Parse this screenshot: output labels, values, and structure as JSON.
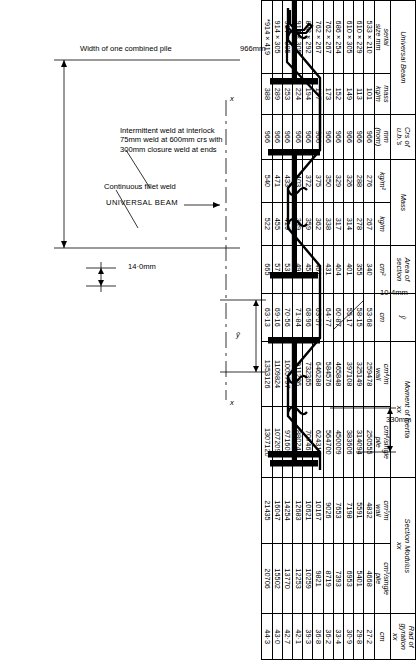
{
  "document": {
    "type": "engineering-reference-table",
    "subject": "Combined sheet pile wall section properties"
  },
  "diagram": {
    "labels": {
      "dim_330": "330mm",
      "dim_10_4": "10·4mm",
      "dim_14_0": "14·0mm",
      "weld_intermittent": "Intermittent weld at interlock\n75mm weld at 600mm crs with\n300mm closure weld at ends",
      "weld_continuous": "Continuous fillet weld",
      "width_combined": "Width of one combined pile",
      "dim_966": "966mm",
      "universal_beam": "UNIVERSAL BEAM",
      "axis_x_left": "x",
      "axis_x_right": "x",
      "axis_y_bar": "ȳ"
    }
  },
  "table": {
    "group_headers": [
      {
        "label": "Universal Beam",
        "span": 2
      },
      {
        "label": "Crs of\nu.b.'s",
        "span": 1
      },
      {
        "label": "Mass",
        "span": 2
      },
      {
        "label": "Area of\nsection",
        "span": 1
      },
      {
        "label": "ȳ",
        "span": 1
      },
      {
        "label": "Moment of Inertia\nxx",
        "span": 2
      },
      {
        "label": "Section Modulus\nxx",
        "span": 2
      },
      {
        "label": "Rad of\ngyration\nxx",
        "span": 1
      }
    ],
    "columns": [
      {
        "key": "serial_size",
        "header_top": "serial",
        "header_bot": "size mm"
      },
      {
        "key": "ub_mass",
        "header_top": "mass",
        "header_bot": "kg/m"
      },
      {
        "key": "crs",
        "header_top": "mm",
        "header_bot": "(nom)"
      },
      {
        "key": "mass_kgm2",
        "header_top": "kg/m²",
        "header_bot": ""
      },
      {
        "key": "mass_kgm",
        "header_top": "kg/m",
        "header_bot": ""
      },
      {
        "key": "area",
        "header_top": "cm²",
        "header_bot": ""
      },
      {
        "key": "ybar",
        "header_top": "cm",
        "header_bot": ""
      },
      {
        "key": "I_m_wall",
        "header_top": "cm⁴/m",
        "header_bot": "wall"
      },
      {
        "key": "I_single",
        "header_top": "cm⁴/single",
        "header_bot": "pile"
      },
      {
        "key": "Z_m_wall",
        "header_top": "cm³/m",
        "header_bot": "wall"
      },
      {
        "key": "Z_single",
        "header_top": "cm³/single",
        "header_bot": "pile"
      },
      {
        "key": "r_xx",
        "header_top": "cm",
        "header_bot": ""
      }
    ],
    "rows": [
      {
        "serial_size": "533 × 210",
        "ub_mass": "101",
        "crs": "966",
        "mass_kgm2": "276",
        "mass_kgm": "267",
        "area": "340",
        "ybar": "53·68",
        "I_m_wall": "259478",
        "I_single": "250555",
        "Z_m_wall": "4832",
        "Z_single": "4668",
        "r_xx": "27·2"
      },
      {
        "serial_size": "610 × 229",
        "ub_mass": "113",
        "crs": "966",
        "mass_kgm2": "288",
        "mass_kgm": "278",
        "area": "355",
        "ybar": "58·15",
        "I_m_wall": "325149",
        "I_single": "314094",
        "Z_m_wall": "5591",
        "Z_single": "5401",
        "r_xx": "29·8"
      },
      {
        "serial_size": "610 × 305",
        "ub_mass": "149",
        "crs": "966",
        "mass_kgm2": "326",
        "mass_kgm": "314",
        "area": "401",
        "ybar": "55·17",
        "I_m_wall": "397108",
        "I_single": "383606",
        "Z_m_wall": "7198",
        "Z_single": "6953",
        "r_xx": "30·9"
      },
      {
        "serial_size": "686 × 254",
        "ub_mass": "152",
        "crs": "966",
        "mass_kgm2": "329",
        "mass_kgm": "317",
        "area": "404",
        "ybar": "60·87",
        "I_m_wall": "465848",
        "I_single": "450009",
        "Z_m_wall": "7653",
        "Z_single": "7393",
        "r_xx": "33·4"
      },
      {
        "serial_size": "762 × 267",
        "ub_mass": "173",
        "crs": "966",
        "mass_kgm2": "350",
        "mass_kgm": "338",
        "area": "431",
        "ybar": "64·77",
        "I_m_wall": "584576",
        "I_single": "564700",
        "Z_m_wall": "9026",
        "Z_single": "8719",
        "r_xx": "36·2"
      },
      {
        "serial_size": "762 × 267",
        "ub_mass": "197",
        "crs": "966",
        "mass_kgm2": "375",
        "mass_kgm": "362",
        "area": "461",
        "ybar": "63·57",
        "I_m_wall": "646288",
        "I_single": "624314",
        "Z_m_wall": "10167",
        "Z_single": "9821",
        "r_xx": "36·8"
      },
      {
        "serial_size": "838 × 292",
        "ub_mass": "194",
        "crs": "966",
        "mass_kgm2": "372",
        "mass_kgm": "359",
        "area": "458",
        "ybar": "68·96",
        "I_m_wall": "732365",
        "I_single": "707465",
        "Z_m_wall": "10621",
        "Z_single": "10259",
        "r_xx": "39·3"
      },
      {
        "serial_size": "914 × 305",
        "ub_mass": "224",
        "crs": "966",
        "mass_kgm2": "403",
        "mass_kgm": "389",
        "area": "496",
        "ybar": "71·84",
        "I_m_wall": "911226",
        "I_single": "880244",
        "Z_m_wall": "12683",
        "Z_single": "12253",
        "r_xx": "42·1"
      },
      {
        "serial_size": "914 × 305",
        "ub_mass": "253",
        "crs": "966",
        "mass_kgm2": "433",
        "mass_kgm": "419",
        "area": "533",
        "ybar": "70·56",
        "I_m_wall": "1005797",
        "I_single": "971600",
        "Z_m_wall": "14254",
        "Z_single": "13770",
        "r_xx": "42·7"
      },
      {
        "serial_size": "914 × 305",
        "ub_mass": "289",
        "crs": "966",
        "mass_kgm2": "471",
        "mass_kgm": "455",
        "area": "579",
        "ybar": "69·16",
        "I_m_wall": "1109824",
        "I_single": "1072090",
        "Z_m_wall": "16047",
        "Z_single": "15502",
        "r_xx": "43·0"
      },
      {
        "serial_size": "*914 × 419",
        "ub_mass": "388",
        "crs": "966",
        "mass_kgm2": "540",
        "mass_kgm": "522",
        "area": "665",
        "ybar": "63·13",
        "I_m_wall": "1353126",
        "I_single": "1307120",
        "Z_m_wall": "21435",
        "Z_single": "20706",
        "r_xx": "44·3"
      }
    ]
  },
  "colors": {
    "ink": "#000000",
    "paper": "#ffffff"
  }
}
